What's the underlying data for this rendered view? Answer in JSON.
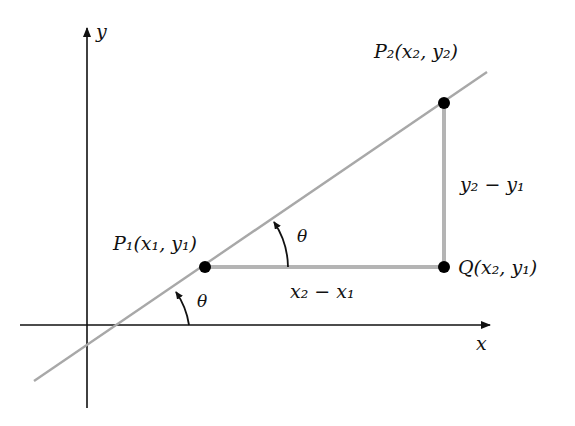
{
  "diagram": {
    "type": "slope-of-line",
    "axes": {
      "x_label": "x",
      "y_label": "y"
    },
    "points": [
      {
        "name": "P1",
        "label": "P₁(x₁, y₁)",
        "x": 205,
        "y": 267
      },
      {
        "name": "P2",
        "label": "P₂(x₂, y₂)",
        "x": 444,
        "y": 103
      },
      {
        "name": "Q",
        "label": "Q(x₂, y₁)",
        "x": 444,
        "y": 267
      }
    ],
    "segments": {
      "horizontal_label": "x₂ − x₁",
      "vertical_label": "y₂ − y₁"
    },
    "angles": [
      {
        "label": "θ",
        "at": "x-axis intersection"
      },
      {
        "label": "θ",
        "at": "P1"
      }
    ],
    "colors": {
      "axis": "#111111",
      "line": "#a8a8a8",
      "segment": "#b4b4b4",
      "point": "#000000"
    }
  }
}
